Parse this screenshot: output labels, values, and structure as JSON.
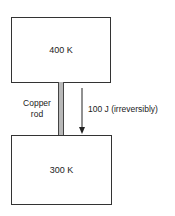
{
  "diagram": {
    "hot_reservoir": {
      "label": "400 K"
    },
    "cold_reservoir": {
      "label": "300 K"
    },
    "rod": {
      "label_line1": "Copper",
      "label_line2": "rod"
    },
    "heat_flow": {
      "label": "100 J (irreversibly)",
      "direction": "down"
    }
  }
}
